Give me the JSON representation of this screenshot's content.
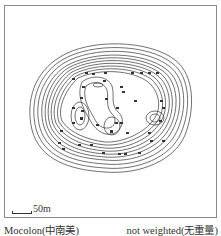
{
  "figure": {
    "scale_label": "50m",
    "caption_left": "Mocolon(中南美)",
    "caption_right": "not weighted(无重量)"
  },
  "diagram": {
    "type": "contour-map",
    "line_color": "#333333",
    "frame_color": "#8a8a8a",
    "outer_contours": 14,
    "inner_peaks": 4,
    "sample_points": 60
  }
}
